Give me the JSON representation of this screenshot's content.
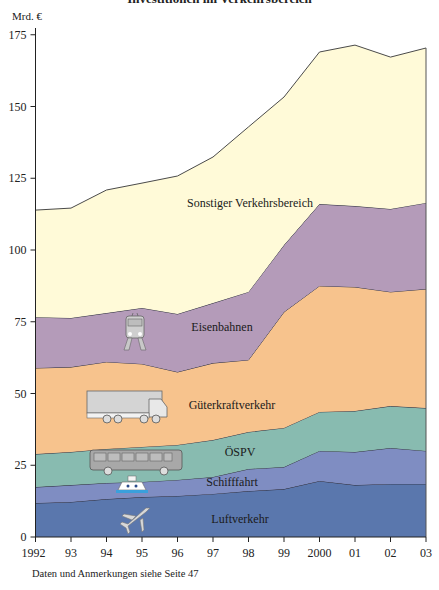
{
  "header": {
    "title": "Investitionen im Verkehrsbereich",
    "unit": "Mrd. €"
  },
  "footnote": "Daten und Anmerkungen siehe Seite 47",
  "colors": {
    "Luftverkehr": "#5a77ad",
    "Schifffahrt": "#7f8dc2",
    "OESPV": "#88bbb0",
    "Gueterkraftverkehr": "#f7c38d",
    "Eisenbahnen": "#b49bb9",
    "Sonstiger": "#fffad8",
    "line": "#3b3b3b"
  },
  "chart_data": {
    "type": "area",
    "stacked": true,
    "title": "Investitionen im Verkehrsbereich",
    "xlabel": "",
    "ylabel": "Mrd. €",
    "ylim": [
      0,
      175
    ],
    "yticks": [
      0,
      25,
      50,
      75,
      100,
      125,
      150,
      175
    ],
    "grid": false,
    "legend": "inline labels",
    "x": [
      1992,
      1993,
      1994,
      1995,
      1996,
      1997,
      1998,
      1999,
      2000,
      2001,
      2002,
      2003
    ],
    "xtick_labels": [
      "1992",
      "93",
      "94",
      "95",
      "96",
      "97",
      "98",
      "99",
      "2000",
      "01",
      "02",
      "03"
    ],
    "series": [
      {
        "name": "Luftverkehr",
        "color_key": "Luftverkehr",
        "values": [
          11.8,
          12.2,
          13.2,
          13.9,
          14.3,
          15.0,
          16.0,
          16.7,
          19.5,
          18.1,
          18.5,
          18.5
        ]
      },
      {
        "name": "Schifffahrt",
        "color_key": "Schifffahrt",
        "values": [
          5.6,
          5.9,
          5.6,
          5.3,
          5.6,
          5.9,
          7.7,
          7.7,
          10.5,
          11.5,
          12.5,
          11.5
        ]
      },
      {
        "name": "ÖSPV",
        "color_key": "OESPV",
        "values": [
          11.5,
          11.5,
          11.9,
          12.2,
          12.2,
          12.9,
          12.9,
          13.6,
          13.6,
          14.3,
          14.6,
          14.9
        ]
      },
      {
        "name": "Güterkraftverkehr",
        "color_key": "Gueterkraftverkehr",
        "values": [
          30.0,
          29.6,
          30.3,
          28.9,
          25.4,
          26.8,
          25.1,
          40.4,
          43.9,
          43.2,
          39.8,
          41.5
        ]
      },
      {
        "name": "Eisenbahnen",
        "color_key": "Eisenbahnen",
        "values": [
          17.7,
          17.1,
          17.0,
          19.5,
          20.2,
          20.9,
          23.7,
          23.3,
          28.5,
          28.2,
          28.9,
          30.0
        ]
      },
      {
        "name": "Sonstiger Verkehrsbereich",
        "color_key": "Sonstiger",
        "values": [
          37.3,
          38.3,
          42.9,
          43.5,
          48.1,
          50.9,
          57.5,
          51.6,
          53.0,
          56.1,
          52.9,
          54.0
        ]
      }
    ],
    "annotations": [
      {
        "text": "Sonstiger Verkehrsbereich",
        "x": 250,
        "y": 207,
        "icon": "none"
      },
      {
        "text": "Eisenbahnen",
        "x": 222,
        "y": 331,
        "icon": "train-icon"
      },
      {
        "text": "Güterkraftverkehr",
        "x": 232,
        "y": 409,
        "icon": "truck-icon"
      },
      {
        "text": "ÖSPV",
        "x": 240,
        "y": 456,
        "icon": "bus-icon"
      },
      {
        "text": "Schifffahrt",
        "x": 232,
        "y": 486,
        "icon": "ship-icon"
      },
      {
        "text": "Luftverkehr",
        "x": 240,
        "y": 523,
        "icon": "airplane-icon"
      }
    ]
  }
}
